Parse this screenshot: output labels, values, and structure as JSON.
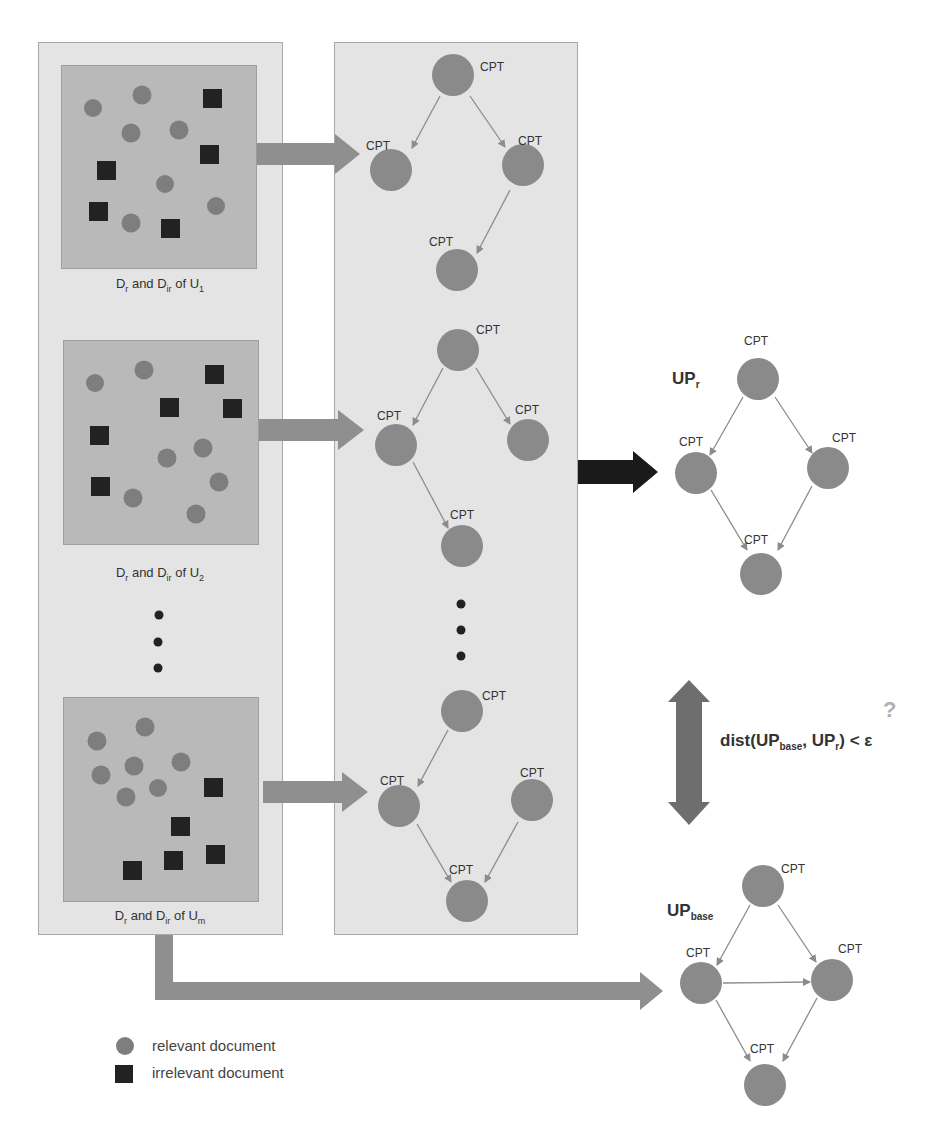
{
  "colors": {
    "panel_bg": "#e4e4e4",
    "doc_box_bg": "#b9b9b9",
    "relevant_doc": "#7e7e7e",
    "irrelevant_doc": "#222222",
    "node": "#8a8a8a",
    "edge": "#8c8c8c",
    "fat_arrow": "#8f8f8f",
    "result_arrow": "#1a1a1a",
    "question_mark": "#b0b0b0"
  },
  "left_column": {
    "groups": [
      {
        "caption_main": "D",
        "caption_r": "r",
        "caption_and": " and D",
        "caption_ir": "ir",
        "caption_of": " of U",
        "caption_sub": "1"
      },
      {
        "caption_main": "D",
        "caption_r": "r",
        "caption_and": " and D",
        "caption_ir": "ir",
        "caption_of": " of U",
        "caption_sub": "2"
      },
      {
        "caption_main": "D",
        "caption_r": "r",
        "caption_and": " and D",
        "caption_ir": "ir",
        "caption_of": " of U",
        "caption_sub": "m"
      }
    ],
    "ellipsis": "⋮"
  },
  "middle_column": {
    "node_label": "CPT",
    "networks": 3
  },
  "right_column": {
    "up_r": {
      "label": "UP",
      "sub": "r",
      "node_label": "CPT"
    },
    "distance": {
      "prefix": "dist(UP",
      "sub_base": "base",
      "mid": ", UP",
      "sub_r": "r",
      "suffix": ") < ε",
      "question": "?"
    },
    "up_base": {
      "label": "UP",
      "sub": "base",
      "node_label": "CPT"
    }
  },
  "legend": {
    "relevant": "relevant document",
    "irrelevant": "irrelevant document"
  }
}
